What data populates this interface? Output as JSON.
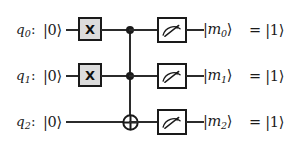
{
  "diagram": {
    "colors": {
      "wire": "#2b2b2b",
      "gate_border": "#1a1a1a",
      "x_gate_fill": "#dcdcdc",
      "measure_fill": "#ffffff",
      "background": "#ffffff"
    }
  },
  "rows": [
    {
      "qubit_name": "q",
      "qubit_index": "0",
      "qubit_colon": ":",
      "init_state": "|0⟩",
      "gate_x_label": "X",
      "measure_icon": "meter-icon",
      "output_ket_open": "|",
      "output_var": "m",
      "output_index": "0",
      "output_ket_close": "⟩",
      "result": "= |1⟩"
    },
    {
      "qubit_name": "q",
      "qubit_index": "1",
      "qubit_colon": ":",
      "init_state": "|0⟩",
      "gate_x_label": "X",
      "measure_icon": "meter-icon",
      "output_ket_open": "|",
      "output_var": "m",
      "output_index": "1",
      "output_ket_close": "⟩",
      "result": "= |1⟩"
    },
    {
      "qubit_name": "q",
      "qubit_index": "2",
      "qubit_colon": ":",
      "init_state": "|0⟩",
      "gate_x_label": "",
      "measure_icon": "meter-icon",
      "output_ket_open": "|",
      "output_var": "m",
      "output_index": "2",
      "output_ket_close": "⟩",
      "result": "= |1⟩"
    }
  ]
}
